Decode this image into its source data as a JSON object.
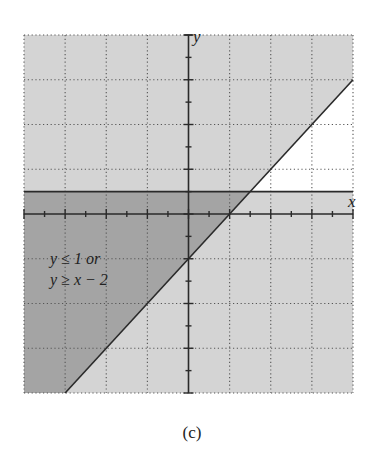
{
  "chart_data": {
    "type": "area",
    "title": "",
    "caption": "(c)",
    "xlabel": "x",
    "ylabel": "y",
    "xlim": [
      -8,
      8
    ],
    "ylim": [
      -8,
      8
    ],
    "grid": true,
    "grid_step": 2,
    "tick_step": 1,
    "boundaries": [
      {
        "name": "y = 1",
        "type": "horizontal",
        "y": 1,
        "style": "solid"
      },
      {
        "name": "y = x - 2",
        "type": "line",
        "slope": 1,
        "intercept": -2,
        "style": "solid"
      }
    ],
    "regions": [
      {
        "name": "y <= 1 or y >= x - 2 (union)",
        "fill": "#d4d4d4"
      },
      {
        "name": "y <= 1 and y >= x - 2 (overlap)",
        "fill": "#a4a4a4"
      },
      {
        "name": "y > 1 and y < x - 2 (unshaded)",
        "fill": "#ffffff"
      }
    ],
    "annotation": {
      "lines": [
        "y ≤ 1 or",
        "y ≥ x − 2"
      ],
      "position": [
        -6.6,
        -2.5
      ]
    }
  },
  "labels": {
    "x_axis": "x",
    "y_axis": "y",
    "annotation_line1": "y ≤ 1 or",
    "annotation_line2": "y ≥ x − 2",
    "caption": "(c)"
  },
  "colors": {
    "light": "#d4d4d4",
    "dark": "#a4a4a4",
    "line": "#2a2a2a",
    "grid": "#555555"
  }
}
